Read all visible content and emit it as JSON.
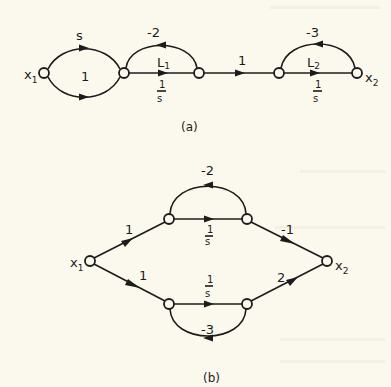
{
  "figure_a": {
    "caption": "(a)",
    "input_node": {
      "name": "x",
      "sub": "1"
    },
    "output_node": {
      "name": "x",
      "sub": "2"
    },
    "edges": {
      "upper_parallel": "s",
      "lower_parallel": "1",
      "loop1_feedback": "-2",
      "L1_forward": {
        "name": "L",
        "sub": "1",
        "num": "1",
        "den": "s"
      },
      "middle": "1",
      "loop2_feedback": "-3",
      "L2_forward": {
        "name": "L",
        "sub": "2",
        "num": "1",
        "den": "s"
      }
    }
  },
  "figure_b": {
    "caption": "(b)",
    "input_node": {
      "name": "x",
      "sub": "1"
    },
    "output_node": {
      "name": "x",
      "sub": "2"
    },
    "edges": {
      "upper_in": "1",
      "lower_in": "1",
      "upper_forward": {
        "num": "1",
        "den": "s"
      },
      "lower_forward": {
        "num": "1",
        "den": "s"
      },
      "upper_feedback": "-2",
      "lower_feedback": "-3",
      "upper_out": "-1",
      "lower_out": "2"
    }
  }
}
